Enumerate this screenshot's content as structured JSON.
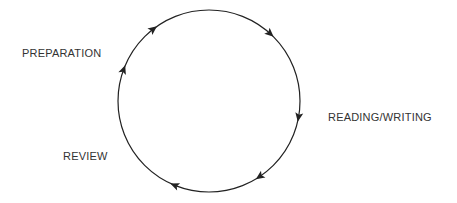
{
  "diagram": {
    "type": "cycle",
    "direction": "clockwise",
    "stroke_color": "#222222",
    "label_color": "#333333",
    "circle": {
      "cx": 209,
      "cy": 101,
      "r": 91
    },
    "stages": [
      {
        "id": "preparation",
        "label": "PREPARATION",
        "x": 22,
        "y": 48
      },
      {
        "id": "reading-writing",
        "label": "READING/WRITING",
        "x": 328,
        "y": 112
      },
      {
        "id": "review",
        "label": "REVIEW",
        "x": 63,
        "y": 151
      }
    ],
    "arrows_angles_deg": [
      -128,
      -48,
      10,
      56,
      112,
      200
    ]
  }
}
